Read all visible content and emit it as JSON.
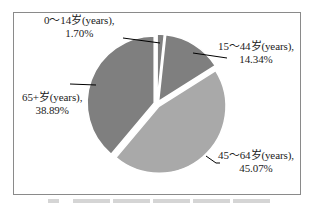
{
  "chart_data": {
    "type": "pie",
    "title": "",
    "categories": [
      "0～14岁(years)",
      "15～44岁(years)",
      "45～64岁(years)",
      "65+岁(years)"
    ],
    "values": [
      1.7,
      14.34,
      45.07,
      38.89
    ],
    "unit": "%",
    "start_angle_deg": 0,
    "direction": "clockwise",
    "exploded": true,
    "colors": [
      "#7f7f7f",
      "#7f7f7f",
      "#a9a9a9",
      "#7f7f7f"
    ],
    "legend": "none",
    "data_labels": [
      {
        "category": "0～14岁(years),",
        "value": "1.70%"
      },
      {
        "category": "15～44岁(years),",
        "value": "14.34%"
      },
      {
        "category": "45～64岁(years),",
        "value": "45.07%"
      },
      {
        "category": "65+岁(years),",
        "value": "38.89%"
      }
    ]
  },
  "labels": [
    {
      "line1": "0～14岁(years),",
      "line2": "1.70%"
    },
    {
      "line1": "15～44岁(years),",
      "line2": "14.34%"
    },
    {
      "line1": "45～64岁(years),",
      "line2": "45.07%"
    },
    {
      "line1": "65+岁(years),",
      "line2": "38.89%"
    }
  ]
}
